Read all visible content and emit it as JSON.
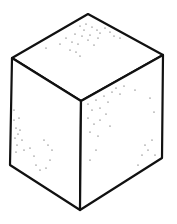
{
  "figure": {
    "style": "line drawing with stippled faces",
    "stroke_color": "#111111",
    "fill_color": "#ffffff"
  }
}
